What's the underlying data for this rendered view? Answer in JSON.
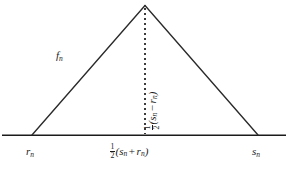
{
  "figure": {
    "type": "triangle-diagram",
    "background_color": "#ffffff",
    "line_color": "#1b1b1b",
    "geometry": {
      "baseline_y": 135,
      "baseline_x_start": 2,
      "baseline_x_end": 286,
      "apex_x": 145,
      "apex_y": 5,
      "left_foot_x": 32,
      "right_foot_x": 258,
      "dotted_line_x": 145
    },
    "labels": {
      "slope_function": {
        "base": "f",
        "sub": "n"
      },
      "left_endpoint": {
        "base": "r",
        "sub": "n"
      },
      "right_endpoint": {
        "base": "s",
        "sub": "n"
      },
      "midpoint": {
        "fraction_numerator": "1",
        "fraction_denominator": "2",
        "open_paren": "(",
        "first_term_base": "s",
        "first_term_sub": "n",
        "operator": "+",
        "second_term_base": "r",
        "second_term_sub": "n",
        "close_paren": ")"
      },
      "height": {
        "fraction_numerator": "1",
        "fraction_denominator": "2",
        "open_paren": "(",
        "first_term_base": "s",
        "first_term_sub": "n",
        "operator": "−",
        "second_term_base": "r",
        "second_term_sub": "n",
        "close_paren": ")"
      }
    }
  }
}
